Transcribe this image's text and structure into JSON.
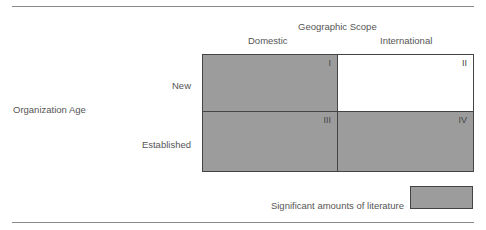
{
  "diagram": {
    "column_axis_title": "Geographic Scope",
    "columns": [
      "Domestic",
      "International"
    ],
    "row_axis_title": "Organization Age",
    "rows": [
      "New",
      "Established"
    ],
    "cells": [
      {
        "id": "I",
        "row": "New",
        "column": "Domestic",
        "shaded": true
      },
      {
        "id": "II",
        "row": "New",
        "column": "International",
        "shaded": false
      },
      {
        "id": "III",
        "row": "Established",
        "column": "Domestic",
        "shaded": true
      },
      {
        "id": "IV",
        "row": "Established",
        "column": "International",
        "shaded": true
      }
    ],
    "legend": {
      "label": "Significant amounts of literature",
      "swatch_color": "#9c9c9c"
    }
  },
  "colors": {
    "shaded": "#9c9c9c",
    "border": "#444444",
    "text": "#555555"
  }
}
